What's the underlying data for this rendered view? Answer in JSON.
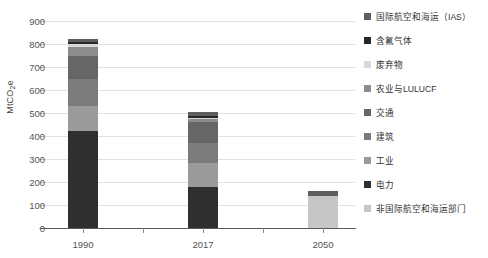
{
  "chart_data": {
    "type": "bar",
    "subtype": "stacked-bar",
    "title": "",
    "xlabel": "",
    "ylabel": "MtCO2e",
    "ylabel_display": "MtCO₂e",
    "categories": [
      "1990",
      "2017",
      "2050"
    ],
    "ylim": [
      0,
      900
    ],
    "yticks": [
      0,
      100,
      200,
      300,
      400,
      500,
      600,
      700,
      800,
      900
    ],
    "ytick_labels": [
      "0",
      "100",
      "200",
      "300",
      "400",
      "500",
      "600",
      "700",
      "800",
      "900"
    ],
    "grid": true,
    "legend_position": "right",
    "stack_order_bottom_to_top": [
      "非国际航空和海运部门",
      "电力",
      "工业",
      "建筑",
      "交通",
      "农业与LULUCF",
      "废弃物",
      "含氟气体",
      "国际航空和海运（IAS）"
    ],
    "series": [
      {
        "name": "非国际航空和海运部门",
        "color": "#c6c6c6",
        "values": [
          0,
          0,
          138
        ]
      },
      {
        "name": "电力",
        "color": "#2f2f2f",
        "values": [
          420,
          180,
          0
        ]
      },
      {
        "name": "工业",
        "color": "#9a9a9a",
        "values": [
          112,
          104,
          0
        ]
      },
      {
        "name": "建筑",
        "color": "#7b7b7b",
        "values": [
          118,
          86,
          0
        ]
      },
      {
        "name": "交通",
        "color": "#666666",
        "values": [
          100,
          92,
          0
        ]
      },
      {
        "name": "农业与LULUCF",
        "color": "#8c8c8c",
        "values": [
          36,
          10,
          0
        ]
      },
      {
        "name": "废弃物",
        "color": "#d9d9d9",
        "values": [
          14,
          6,
          0
        ]
      },
      {
        "name": "含氟气体",
        "color": "#272727",
        "values": [
          8,
          10,
          0
        ]
      },
      {
        "name": "国际航空和海运（IAS）",
        "color": "#5e5e5e",
        "values": [
          13,
          18,
          24
        ]
      }
    ],
    "totals": [
      821,
      506,
      162
    ]
  },
  "legend": {
    "items": [
      {
        "label": "国际航空和海运（IAS）",
        "color": "#5e5e5e"
      },
      {
        "label": "含氟气体",
        "color": "#272727"
      },
      {
        "label": "废弃物",
        "color": "#d9d9d9"
      },
      {
        "label": "农业与LULUCF",
        "color": "#8c8c8c"
      },
      {
        "label": "交通",
        "color": "#666666"
      },
      {
        "label": "建筑",
        "color": "#7b7b7b"
      },
      {
        "label": "工业",
        "color": "#9a9a9a"
      },
      {
        "label": "电力",
        "color": "#2f2f2f"
      },
      {
        "label": "非国际航空和海运部门",
        "color": "#c6c6c6"
      }
    ]
  },
  "colors": {
    "gridline": "#e2e2e2",
    "axis": "#5a5a5a",
    "tick_label": "#555555",
    "background": "#ffffff"
  }
}
